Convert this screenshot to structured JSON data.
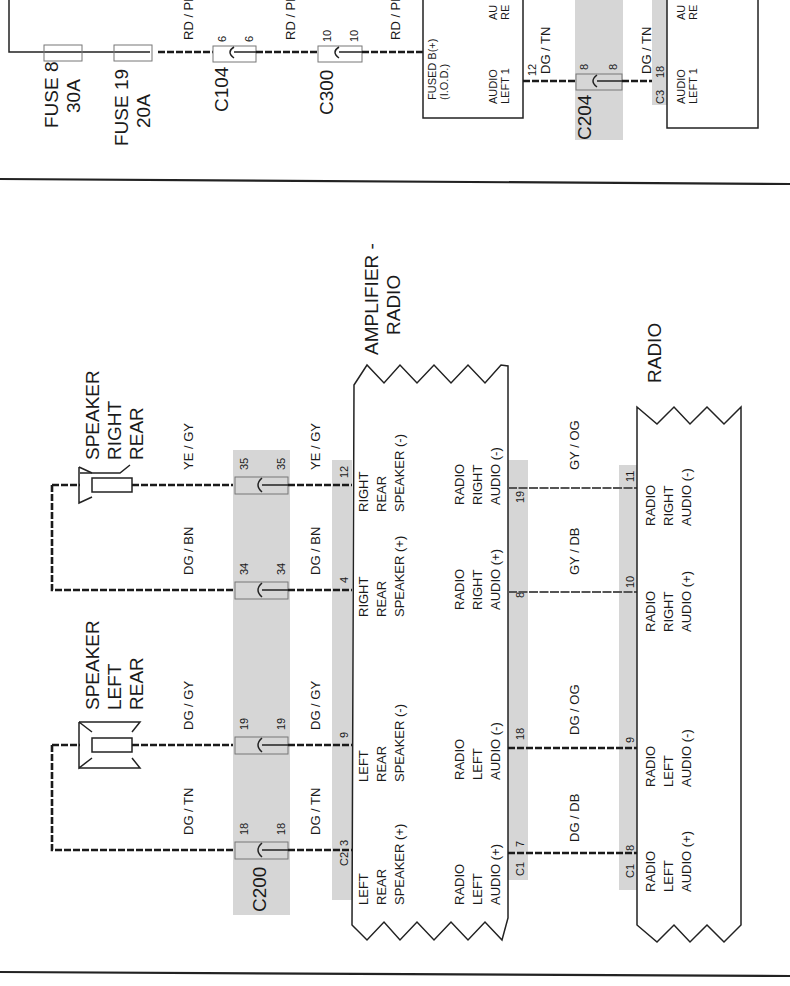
{
  "top_section": {
    "fuses": [
      {
        "name": "FUSE 8",
        "rating": "30A"
      },
      {
        "name": "FUSE 19",
        "rating": "20A"
      }
    ],
    "wire_colors": [
      "RD / PK",
      "RD / PK",
      "RD / PK"
    ],
    "connectors": [
      {
        "id": "C104",
        "pin_left": "6",
        "pin_right": "6"
      },
      {
        "id": "C300",
        "pin_left": "10",
        "pin_right": "10"
      },
      {
        "id": "C204",
        "pin_left": "8",
        "pin_right": "8"
      }
    ],
    "left_module": {
      "pin_fused": "FUSED B(+)",
      "pin_fused_sub": "(I.O.D.)",
      "pin_audio_line1": "AUDIO",
      "pin_audio_line2": "LEFT 1",
      "pin_clipped_line1": "AU",
      "pin_clipped_line2": "RE",
      "pin_number": "12",
      "wire_color": "DG / TN"
    },
    "right_module": {
      "connector": "C3",
      "pin_number": "18",
      "wire_color": "DG / TN",
      "pin_audio_line1": "AUDIO",
      "pin_audio_line2": "LEFT 1",
      "pin_clipped_line1": "AU",
      "pin_clipped_line2": "RE"
    }
  },
  "bottom_section": {
    "speakers": [
      {
        "id": "speaker-right-rear",
        "lines": [
          "SPEAKER",
          "RIGHT",
          "REAR"
        ]
      },
      {
        "id": "speaker-left-rear",
        "lines": [
          "SPEAKER",
          "LEFT",
          "REAR"
        ]
      }
    ],
    "inline_connector": {
      "id": "C200"
    },
    "speaker_wires": [
      {
        "color_left": "YE / GY",
        "color_right": "YE / GY",
        "c200_pin": "35",
        "amp_pin": "12"
      },
      {
        "color_left": "DG / BN",
        "color_right": "DG / BN",
        "c200_pin": "34",
        "amp_pin": "4"
      },
      {
        "color_left": "DG / GY",
        "color_right": "DG / GY",
        "c200_pin": "19",
        "amp_pin": "9"
      },
      {
        "color_left": "DG / TN",
        "color_right": "DG / TN",
        "c200_pin": "18",
        "amp_pin": "3"
      }
    ],
    "amplifier": {
      "title_line1": "AMPLIFIER -",
      "title_line2": "RADIO",
      "connector_speaker": "C2",
      "connector_audio": "C1",
      "speaker_pins": [
        {
          "lines": [
            "RIGHT",
            "REAR",
            "SPEAKER (-)"
          ]
        },
        {
          "lines": [
            "RIGHT",
            "REAR",
            "SPEAKER (+)"
          ]
        },
        {
          "lines": [
            "LEFT",
            "REAR",
            "SPEAKER (-)"
          ]
        },
        {
          "lines": [
            "LEFT",
            "REAR",
            "SPEAKER (+)"
          ]
        }
      ],
      "audio_pins": [
        {
          "pin": "19",
          "lines": [
            "RADIO",
            "RIGHT",
            "AUDIO (-)"
          ]
        },
        {
          "pin": "8",
          "lines": [
            "RADIO",
            "RIGHT",
            "AUDIO (+)"
          ]
        },
        {
          "pin": "18",
          "lines": [
            "RADIO",
            "LEFT",
            "AUDIO (-)"
          ]
        },
        {
          "pin": "7",
          "lines": [
            "RADIO",
            "LEFT",
            "AUDIO (+)"
          ]
        }
      ]
    },
    "audio_wires": [
      {
        "color": "GY / OG"
      },
      {
        "color": "GY / DB"
      },
      {
        "color": "DG / OG"
      },
      {
        "color": "DG / DB"
      }
    ],
    "radio": {
      "title": "RADIO",
      "connector": "C1",
      "pins": [
        {
          "pin": "11",
          "lines": [
            "RADIO",
            "RIGHT",
            "AUDIO (-)"
          ]
        },
        {
          "pin": "10",
          "lines": [
            "RADIO",
            "RIGHT",
            "AUDIO (+)"
          ]
        },
        {
          "pin": "9",
          "lines": [
            "RADIO",
            "LEFT",
            "AUDIO (-)"
          ]
        },
        {
          "pin": "8",
          "lines": [
            "RADIO",
            "LEFT",
            "AUDIO (+)"
          ]
        }
      ]
    }
  }
}
